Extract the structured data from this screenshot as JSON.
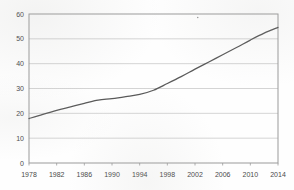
{
  "chart_data": {
    "type": "line",
    "title": "",
    "subtitle": "",
    "xlabel": "",
    "ylabel": "",
    "x": [
      1978,
      1980,
      1982,
      1984,
      1986,
      1988,
      1990,
      1992,
      1994,
      1996,
      1998,
      2000,
      2002,
      2004,
      2006,
      2008,
      2010,
      2012,
      2014
    ],
    "series": [
      {
        "name": "value",
        "values": [
          17.9,
          19.6,
          21.2,
          22.6,
          24.0,
          25.3,
          25.9,
          26.7,
          27.6,
          29.3,
          32.0,
          34.8,
          37.8,
          40.7,
          43.6,
          46.5,
          49.5,
          52.3,
          54.6
        ]
      }
    ],
    "xticks": [
      "1978",
      "1982",
      "1986",
      "1990",
      "1994",
      "1998",
      "2002",
      "2006",
      "2010",
      "2014"
    ],
    "xtick_values": [
      1978,
      1982,
      1986,
      1990,
      1994,
      1998,
      2002,
      2006,
      2010,
      2014
    ],
    "yticks": [
      "0",
      "10",
      "20",
      "30",
      "40",
      "50",
      "60"
    ],
    "ytick_values": [
      0,
      10,
      20,
      30,
      40,
      50,
      60
    ],
    "xlim": [
      1978,
      2014
    ],
    "ylim": [
      0,
      60
    ],
    "grid": true,
    "grid_axis": "y",
    "legend": false,
    "legend_position": "none",
    "line_color": "#595959",
    "grid_color": "#c9c9c9",
    "frame_color": "#9a9a9a",
    "background_color": "#fefefe",
    "tick_label_color": "#4a4a4a",
    "annotations": [
      {
        "name": "scan-speck",
        "x": 2002.4,
        "y": 58.6
      }
    ]
  }
}
